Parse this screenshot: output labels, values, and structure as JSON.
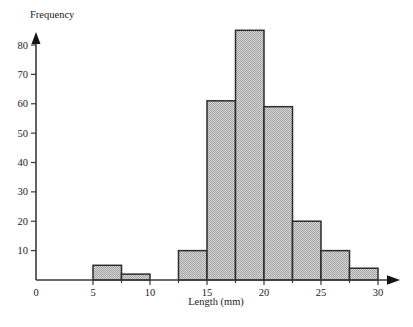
{
  "chart_data": {
    "type": "bar",
    "title": "",
    "subtitle": "",
    "xlabel": "Length (mm)",
    "ylabel": "Frequency",
    "xlim": [
      0,
      31.5
    ],
    "ylim": [
      0,
      88
    ],
    "grid": false,
    "legend": null,
    "bar_width": 2.5,
    "x_tick_labels": [
      "0",
      "5",
      "10",
      "15",
      "20",
      "25",
      "30"
    ],
    "x_tick_values": [
      0,
      5,
      10,
      15,
      20,
      25,
      30
    ],
    "y_tick_labels": [
      "10",
      "20",
      "30",
      "40",
      "50",
      "60",
      "70",
      "80"
    ],
    "y_tick_values": [
      10,
      20,
      30,
      40,
      50,
      60,
      70,
      80
    ],
    "bin_edges": [
      5,
      7.5,
      10,
      12.5,
      15,
      17.5,
      20,
      22.5,
      25,
      27.5,
      30
    ],
    "bins": [
      {
        "start": 5,
        "end": 7.5,
        "value": 5
      },
      {
        "start": 7.5,
        "end": 10,
        "value": 2
      },
      {
        "start": 10,
        "end": 12.5,
        "value": 0
      },
      {
        "start": 12.5,
        "end": 15,
        "value": 10
      },
      {
        "start": 15,
        "end": 17.5,
        "value": 61
      },
      {
        "start": 17.5,
        "end": 20,
        "value": 85
      },
      {
        "start": 20,
        "end": 22.5,
        "value": 59
      },
      {
        "start": 22.5,
        "end": 25,
        "value": 20
      },
      {
        "start": 25,
        "end": 27.5,
        "value": 10
      },
      {
        "start": 27.5,
        "end": 30,
        "value": 4
      }
    ],
    "categories": [
      "5-7.5",
      "7.5-10",
      "10-12.5",
      "12.5-15",
      "15-17.5",
      "17.5-20",
      "20-22.5",
      "22.5-25",
      "25-27.5",
      "27.5-30"
    ],
    "values": [
      5,
      2,
      0,
      10,
      61,
      85,
      59,
      20,
      10,
      4
    ],
    "colors": {
      "bar_fill": "#c9c9c9",
      "bar_edge": "#2b2b2b",
      "axis": "#3a3a3a",
      "text": "#1a1a1a",
      "background": "#ffffff"
    }
  }
}
